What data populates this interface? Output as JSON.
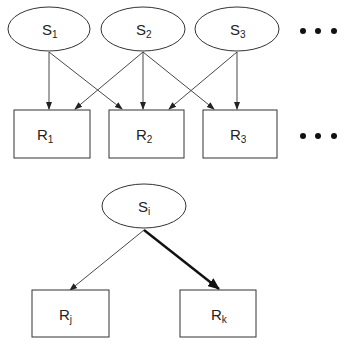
{
  "top": {
    "sources": [
      {
        "label": "S",
        "sub": "1"
      },
      {
        "label": "S",
        "sub": "2"
      },
      {
        "label": "S",
        "sub": "3"
      }
    ],
    "receivers": [
      {
        "label": "R",
        "sub": "1"
      },
      {
        "label": "R",
        "sub": "2"
      },
      {
        "label": "R",
        "sub": "3"
      }
    ],
    "edges": [
      [
        "S1",
        "R1"
      ],
      [
        "S1",
        "R2"
      ],
      [
        "S2",
        "R1"
      ],
      [
        "S2",
        "R2"
      ],
      [
        "S2",
        "R3"
      ],
      [
        "S3",
        "R2"
      ],
      [
        "S3",
        "R3"
      ]
    ],
    "ellipsis": "• • •"
  },
  "bottom": {
    "source": {
      "label": "S",
      "sub": "i"
    },
    "receivers": [
      {
        "label": "R",
        "sub": "j"
      },
      {
        "label": "R",
        "sub": "k"
      }
    ],
    "edges": [
      {
        "from": "Si",
        "to": "Rj",
        "weight": "thin"
      },
      {
        "from": "Si",
        "to": "Rk",
        "weight": "bold"
      }
    ]
  }
}
